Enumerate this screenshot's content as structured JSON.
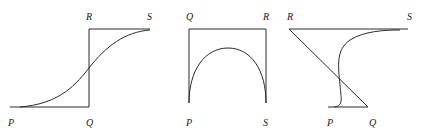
{
  "figures": [
    {
      "id": "fig1",
      "labels": {
        "P": "P",
        "Q": "Q",
        "R": "R",
        "S": "S"
      },
      "description": "Step path P-Q-R-S with smooth sigmoid curve from P to S"
    },
    {
      "id": "fig2",
      "labels": {
        "P": "P",
        "Q": "Q",
        "R": "R",
        "S": "S"
      },
      "description": "Rectangular path P-Q-R-S with semicircular arch curve from P to S"
    },
    {
      "id": "fig3",
      "labels": {
        "P": "P",
        "Q": "Q",
        "R": "R",
        "S": "S"
      },
      "description": "Z-shaped path P-Q-R-S with curved path from P to S"
    }
  ],
  "colors": {
    "stroke": "#2a2a2a",
    "label": "#1a1a1a",
    "background": "#ffffff"
  }
}
